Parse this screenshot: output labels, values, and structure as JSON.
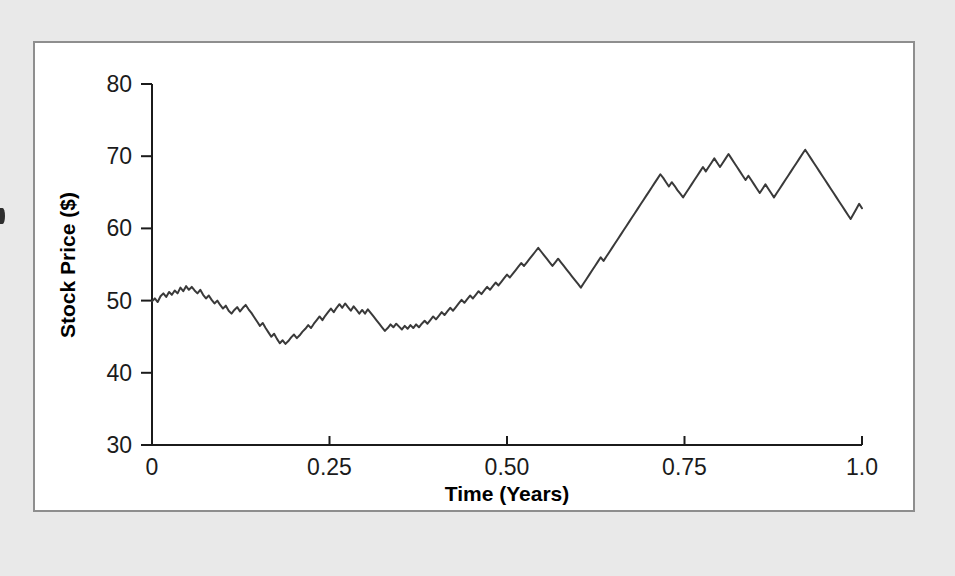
{
  "page": {
    "background_color": "#e9e9e9",
    "panel_background_color": "#ffffff",
    "panel_border_color": "#8e8e8e"
  },
  "chart_data": {
    "type": "line",
    "title": "",
    "subtitle": "",
    "xlabel": "Time (Years)",
    "ylabel": "Stock Price ($)",
    "xlim": [
      0,
      1.0
    ],
    "ylim": [
      30,
      80
    ],
    "xticks": [
      0,
      0.25,
      0.5,
      0.75,
      1.0
    ],
    "xtick_labels": [
      "0",
      "0.25",
      "0.50",
      "0.75",
      "1.0"
    ],
    "yticks": [
      30,
      40,
      50,
      60,
      70,
      80
    ],
    "ytick_labels": [
      "30",
      "40",
      "50",
      "60",
      "70",
      "80"
    ],
    "grid": false,
    "legend": null,
    "line_color": "#3a3a3a",
    "line_width": 2,
    "series": [
      {
        "name": "Stock Price",
        "x": [
          0.0,
          0.004,
          0.008,
          0.012,
          0.016,
          0.02,
          0.024,
          0.028,
          0.032,
          0.036,
          0.04,
          0.044,
          0.048,
          0.052,
          0.056,
          0.06,
          0.064,
          0.068,
          0.072,
          0.076,
          0.08,
          0.084,
          0.088,
          0.092,
          0.096,
          0.1,
          0.104,
          0.108,
          0.112,
          0.116,
          0.12,
          0.124,
          0.128,
          0.132,
          0.136,
          0.14,
          0.144,
          0.148,
          0.152,
          0.156,
          0.16,
          0.164,
          0.168,
          0.172,
          0.176,
          0.18,
          0.184,
          0.188,
          0.192,
          0.196,
          0.2,
          0.204,
          0.208,
          0.212,
          0.216,
          0.22,
          0.224,
          0.228,
          0.232,
          0.236,
          0.24,
          0.244,
          0.248,
          0.252,
          0.256,
          0.26,
          0.264,
          0.268,
          0.272,
          0.276,
          0.28,
          0.284,
          0.288,
          0.292,
          0.296,
          0.3,
          0.304,
          0.308,
          0.312,
          0.316,
          0.32,
          0.324,
          0.328,
          0.332,
          0.336,
          0.34,
          0.344,
          0.348,
          0.352,
          0.356,
          0.36,
          0.364,
          0.368,
          0.372,
          0.376,
          0.38,
          0.384,
          0.388,
          0.392,
          0.396,
          0.4,
          0.404,
          0.408,
          0.412,
          0.416,
          0.42,
          0.424,
          0.428,
          0.432,
          0.436,
          0.44,
          0.444,
          0.448,
          0.452,
          0.456,
          0.46,
          0.464,
          0.468,
          0.472,
          0.476,
          0.48,
          0.484,
          0.488,
          0.492,
          0.496,
          0.5,
          0.504,
          0.508,
          0.512,
          0.516,
          0.52,
          0.524,
          0.528,
          0.532,
          0.536,
          0.54,
          0.544,
          0.548,
          0.552,
          0.556,
          0.56,
          0.564,
          0.568,
          0.572,
          0.576,
          0.58,
          0.584,
          0.588,
          0.592,
          0.596,
          0.6,
          0.604,
          0.608,
          0.612,
          0.616,
          0.62,
          0.624,
          0.628,
          0.632,
          0.636,
          0.64,
          0.644,
          0.648,
          0.652,
          0.656,
          0.66,
          0.664,
          0.668,
          0.672,
          0.676,
          0.68,
          0.684,
          0.688,
          0.692,
          0.696,
          0.7,
          0.704,
          0.708,
          0.712,
          0.716,
          0.72,
          0.724,
          0.728,
          0.732,
          0.736,
          0.74,
          0.744,
          0.748,
          0.752,
          0.756,
          0.76,
          0.764,
          0.768,
          0.772,
          0.776,
          0.78,
          0.784,
          0.788,
          0.792,
          0.796,
          0.8,
          0.804,
          0.808,
          0.812,
          0.816,
          0.82,
          0.824,
          0.828,
          0.832,
          0.836,
          0.84,
          0.844,
          0.848,
          0.852,
          0.856,
          0.86,
          0.864,
          0.868,
          0.872,
          0.876,
          0.88,
          0.884,
          0.888,
          0.892,
          0.896,
          0.9,
          0.904,
          0.908,
          0.912,
          0.916,
          0.92,
          0.924,
          0.928,
          0.932,
          0.936,
          0.94,
          0.944,
          0.948,
          0.952,
          0.956,
          0.96,
          0.964,
          0.968,
          0.972,
          0.976,
          0.98,
          0.984,
          0.988,
          0.992,
          0.996,
          1.0
        ],
        "values": [
          49.9,
          50.3,
          49.8,
          50.6,
          51.0,
          50.5,
          51.2,
          50.8,
          51.4,
          51.0,
          51.8,
          51.3,
          52.0,
          51.5,
          51.9,
          51.4,
          51.0,
          51.5,
          50.8,
          50.3,
          50.7,
          50.1,
          49.6,
          50.0,
          49.4,
          48.9,
          49.3,
          48.6,
          48.2,
          48.7,
          49.1,
          48.5,
          49.0,
          49.4,
          48.8,
          48.3,
          47.7,
          47.1,
          46.5,
          46.9,
          46.2,
          45.6,
          45.0,
          45.4,
          44.7,
          44.1,
          44.5,
          44.0,
          44.4,
          44.9,
          45.3,
          44.8,
          45.2,
          45.7,
          46.1,
          46.6,
          46.2,
          46.8,
          47.3,
          47.8,
          47.3,
          47.9,
          48.4,
          48.9,
          48.4,
          49.0,
          49.5,
          49.0,
          49.6,
          49.1,
          48.6,
          49.2,
          48.7,
          48.2,
          48.7,
          48.2,
          48.8,
          48.3,
          47.8,
          47.3,
          46.8,
          46.3,
          45.8,
          46.2,
          46.7,
          46.3,
          46.8,
          46.4,
          46.0,
          46.5,
          46.1,
          46.6,
          46.2,
          46.7,
          46.3,
          46.8,
          47.2,
          46.8,
          47.3,
          47.8,
          47.4,
          47.9,
          48.4,
          48.0,
          48.5,
          49.0,
          48.6,
          49.1,
          49.6,
          50.1,
          49.7,
          50.2,
          50.7,
          50.3,
          50.8,
          51.3,
          50.9,
          51.4,
          51.9,
          51.5,
          52.0,
          52.5,
          52.1,
          52.6,
          53.1,
          53.6,
          53.2,
          53.7,
          54.2,
          54.7,
          55.2,
          54.8,
          55.3,
          55.8,
          56.3,
          56.8,
          57.3,
          56.8,
          56.3,
          55.8,
          55.3,
          54.8,
          55.3,
          55.8,
          55.3,
          54.8,
          54.3,
          53.8,
          53.3,
          52.8,
          52.3,
          51.8,
          52.4,
          53.0,
          53.6,
          54.2,
          54.8,
          55.4,
          56.0,
          55.5,
          56.1,
          56.7,
          57.3,
          57.9,
          58.5,
          59.1,
          59.7,
          60.3,
          60.9,
          61.5,
          62.1,
          62.7,
          63.3,
          63.9,
          64.5,
          65.1,
          65.7,
          66.3,
          66.9,
          67.5,
          67.0,
          66.4,
          65.8,
          66.4,
          65.9,
          65.3,
          64.8,
          64.3,
          64.9,
          65.5,
          66.1,
          66.7,
          67.3,
          67.9,
          68.5,
          67.9,
          68.5,
          69.1,
          69.7,
          69.1,
          68.5,
          69.1,
          69.7,
          70.3,
          69.7,
          69.1,
          68.5,
          67.9,
          67.3,
          66.7,
          67.3,
          66.7,
          66.1,
          65.5,
          64.9,
          65.5,
          66.1,
          65.5,
          64.9,
          64.3,
          64.9,
          65.5,
          66.1,
          66.7,
          67.3,
          67.9,
          68.5,
          69.1,
          69.7,
          70.3,
          70.9,
          70.3,
          69.7,
          69.1,
          68.5,
          67.9,
          67.3,
          66.7,
          66.1,
          65.5,
          64.9,
          64.3,
          63.7,
          63.1,
          62.5,
          61.9,
          61.3,
          62.0,
          62.7,
          63.4,
          62.8
        ]
      }
    ],
    "annotations": [],
    "summary": {
      "start_value": 50,
      "end_value": 40,
      "minimum_value": 44,
      "minimum_at": 0.15,
      "maximum_value": 70.9,
      "maximum_at": 0.7
    }
  }
}
